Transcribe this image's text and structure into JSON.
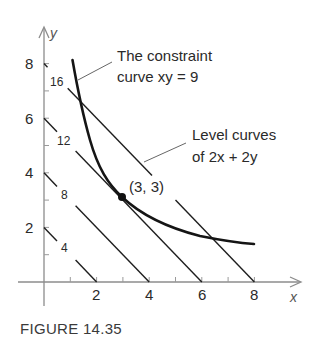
{
  "figure": {
    "caption": "FIGURE 14.35",
    "x_axis_label": "x",
    "y_axis_label": "y",
    "x_tick_labels": [
      "2",
      "4",
      "6",
      "8"
    ],
    "y_tick_labels": [
      "2",
      "4",
      "6",
      "8"
    ],
    "level_labels": [
      "4",
      "8",
      "12",
      "16"
    ],
    "constraint_note_line1": "The constraint",
    "constraint_note_line2": "curve xy = 9",
    "level_note_line1": "Level curves",
    "level_note_line2": "of 2x + 2y",
    "point_label": "(3, 3)"
  },
  "colors": {
    "axis": "#8c8c8c",
    "curve": "#151515",
    "text": "#2a2a2a"
  }
}
